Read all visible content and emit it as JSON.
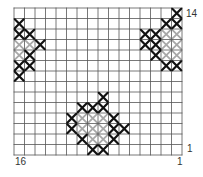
{
  "pattern": {
    "title": "",
    "columns": 16,
    "rows": 14,
    "grid": {
      "left": 14,
      "top": 8,
      "width": 168,
      "height": 147
    },
    "colors": {
      "grid_line": "#555555",
      "background": "#ffffff",
      "stitch_dark": "#111111",
      "stitch_light": "#a8a8a8"
    },
    "labels": {
      "row_top": "14",
      "row_bottom": "1",
      "col_left": "16",
      "col_right": "1"
    },
    "stitches": {
      "dark": [
        [
          0,
          1
        ],
        [
          0,
          2
        ],
        [
          1,
          2
        ],
        [
          2,
          3
        ],
        [
          1,
          4
        ],
        [
          0,
          5
        ],
        [
          1,
          5
        ],
        [
          0,
          6
        ],
        [
          15,
          0
        ],
        [
          14,
          1
        ],
        [
          15,
          1
        ],
        [
          12,
          2
        ],
        [
          13,
          2
        ],
        [
          12,
          3
        ],
        [
          13,
          3
        ],
        [
          13,
          4
        ],
        [
          14,
          5
        ],
        [
          15,
          5
        ],
        [
          8,
          8
        ],
        [
          6,
          9
        ],
        [
          7,
          9
        ],
        [
          8,
          9
        ],
        [
          5,
          10
        ],
        [
          9,
          10
        ],
        [
          5,
          11
        ],
        [
          9,
          11
        ],
        [
          10,
          11
        ],
        [
          6,
          12
        ],
        [
          9,
          12
        ],
        [
          7,
          13
        ],
        [
          8,
          13
        ]
      ],
      "light": [
        [
          0,
          3
        ],
        [
          1,
          3
        ],
        [
          0,
          4
        ],
        [
          14,
          2
        ],
        [
          15,
          2
        ],
        [
          14,
          3
        ],
        [
          15,
          3
        ],
        [
          14,
          4
        ],
        [
          15,
          4
        ],
        [
          6,
          10
        ],
        [
          7,
          10
        ],
        [
          8,
          10
        ],
        [
          6,
          11
        ],
        [
          7,
          11
        ],
        [
          8,
          11
        ],
        [
          7,
          12
        ],
        [
          8,
          12
        ]
      ]
    }
  },
  "chart_data": {
    "type": "heatmap",
    "columns": 16,
    "rows": 14,
    "x_tick_labels": {
      "left": "16",
      "right": "1"
    },
    "y_tick_labels": {
      "top": "14",
      "bottom": "1"
    },
    "grid": true,
    "legend": [],
    "series": [
      {
        "name": "dark stitches (col,row from top-left)",
        "cells": [
          [
            0,
            1
          ],
          [
            0,
            2
          ],
          [
            1,
            2
          ],
          [
            2,
            3
          ],
          [
            1,
            4
          ],
          [
            0,
            5
          ],
          [
            1,
            5
          ],
          [
            0,
            6
          ],
          [
            15,
            0
          ],
          [
            14,
            1
          ],
          [
            15,
            1
          ],
          [
            12,
            2
          ],
          [
            13,
            2
          ],
          [
            12,
            3
          ],
          [
            13,
            3
          ],
          [
            13,
            4
          ],
          [
            14,
            5
          ],
          [
            15,
            5
          ],
          [
            8,
            8
          ],
          [
            6,
            9
          ],
          [
            7,
            9
          ],
          [
            8,
            9
          ],
          [
            5,
            10
          ],
          [
            9,
            10
          ],
          [
            5,
            11
          ],
          [
            9,
            11
          ],
          [
            10,
            11
          ],
          [
            6,
            12
          ],
          [
            9,
            12
          ],
          [
            7,
            13
          ],
          [
            8,
            13
          ]
        ]
      },
      {
        "name": "light stitches (col,row from top-left)",
        "cells": [
          [
            0,
            3
          ],
          [
            1,
            3
          ],
          [
            0,
            4
          ],
          [
            14,
            2
          ],
          [
            15,
            2
          ],
          [
            14,
            3
          ],
          [
            15,
            3
          ],
          [
            14,
            4
          ],
          [
            15,
            4
          ],
          [
            6,
            10
          ],
          [
            7,
            10
          ],
          [
            8,
            10
          ],
          [
            6,
            11
          ],
          [
            7,
            11
          ],
          [
            8,
            11
          ],
          [
            7,
            12
          ],
          [
            8,
            12
          ]
        ]
      }
    ]
  }
}
